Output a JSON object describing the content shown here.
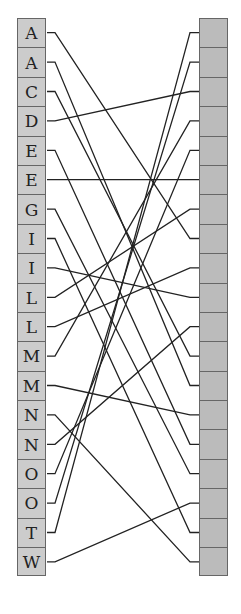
{
  "left_letters": [
    "A",
    "A",
    "C",
    "D",
    "E",
    "E",
    "G",
    "I",
    "I",
    "L",
    "L",
    "M",
    "M",
    "N",
    "N",
    "O",
    "O",
    "T",
    "W"
  ],
  "right_count": 19,
  "connections": [
    [
      0,
      7
    ],
    [
      1,
      12
    ],
    [
      2,
      11
    ],
    [
      3,
      2
    ],
    [
      4,
      14
    ],
    [
      5,
      5
    ],
    [
      6,
      15
    ],
    [
      7,
      17
    ],
    [
      8,
      9
    ],
    [
      9,
      6
    ],
    [
      10,
      8
    ],
    [
      11,
      3
    ],
    [
      12,
      13
    ],
    [
      13,
      18
    ],
    [
      14,
      10
    ],
    [
      15,
      4
    ],
    [
      16,
      1
    ],
    [
      17,
      0
    ],
    [
      18,
      16
    ]
  ],
  "colors": {
    "left_box": "#cccccc",
    "right_box": "#bbbbbb",
    "line": "#222222"
  }
}
